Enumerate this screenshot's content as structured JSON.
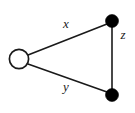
{
  "figure": {
    "background_color": "#ffffff",
    "stroke_color": "#1a1a1a",
    "filled_node_color": "#000000",
    "open_node_fill": "#ffffff"
  },
  "nodes": [
    {
      "id": "left",
      "style": "open",
      "cx": 19,
      "cy": 59,
      "r": 10
    },
    {
      "id": "top-right",
      "style": "filled",
      "cx": 112,
      "cy": 21,
      "r": 6
    },
    {
      "id": "bottom-right",
      "style": "filled",
      "cx": 112,
      "cy": 95,
      "r": 6
    }
  ],
  "edges": [
    {
      "id": "edge-x",
      "from": "left",
      "to": "top-right",
      "label": "x",
      "x1": 28,
      "y1": 55,
      "x2": 107,
      "y2": 24
    },
    {
      "id": "edge-y",
      "from": "left",
      "to": "bottom-right",
      "label": "y",
      "x1": 28,
      "y1": 64,
      "x2": 107,
      "y2": 92
    },
    {
      "id": "edge-z",
      "from": "top-right",
      "to": "bottom-right",
      "label": "z",
      "x1": 112,
      "y1": 26,
      "x2": 112,
      "y2": 90
    }
  ],
  "labels": {
    "x": {
      "text": "x",
      "x": 66,
      "y": 25
    },
    "y": {
      "text": "y",
      "x": 66,
      "y": 88
    },
    "z": {
      "text": "z",
      "x": 123,
      "y": 36
    }
  }
}
